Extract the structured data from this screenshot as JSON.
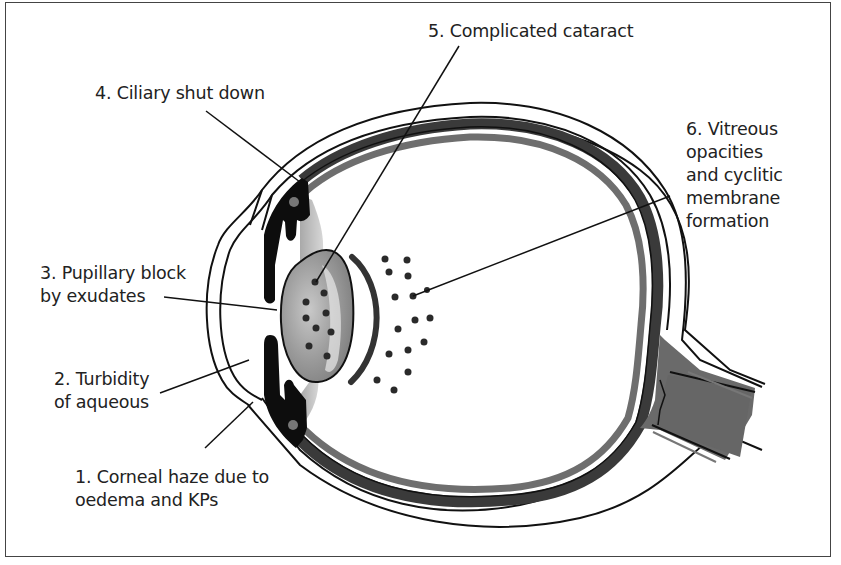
{
  "diagram": {
    "type": "anatomical eye cross-section",
    "colors": {
      "outline": "#111111",
      "choroid_dark": "#3a3a3a",
      "retina_gray": "#6e6e6e",
      "lens_gray": "#9a9a9a",
      "nerve_gray": "#666666",
      "zonule_gray": "#b5b5b5",
      "dots": "#2a2a2a"
    }
  },
  "labels": {
    "l1": "1. Corneal haze due to\noedema and KPs",
    "l2": "2. Turbidity\nof aqueous",
    "l3": "3. Pupillary block\nby exudates",
    "l4": "4. Ciliary shut down",
    "l5": "5. Complicated cataract",
    "l6": "6. Vitreous\nopacities\nand cyclitic\nmembrane\nformation"
  }
}
